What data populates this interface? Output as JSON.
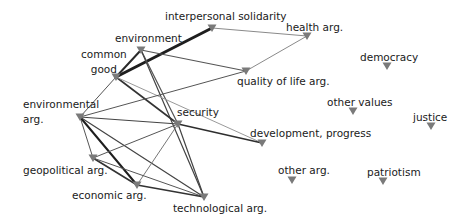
{
  "diagram": {
    "type": "network",
    "node_color": "#7a7a7a",
    "nodes": [
      {
        "id": "interpersonal_solidarity",
        "label": "interpersonal solidarity",
        "x": 212,
        "y": 28,
        "lx": 165,
        "ly": 10
      },
      {
        "id": "health",
        "label": "health arg.",
        "x": 307,
        "y": 36,
        "lx": 286,
        "ly": 21
      },
      {
        "id": "environment",
        "label": "environment",
        "x": 141,
        "y": 50,
        "lx": 115,
        "ly": 32
      },
      {
        "id": "common_good",
        "label": "common\ngood",
        "x": 116,
        "y": 77,
        "lx": 81,
        "ly": 47
      },
      {
        "id": "quality_of_life",
        "label": "quality of life arg.",
        "x": 246,
        "y": 71,
        "lx": 237,
        "ly": 75
      },
      {
        "id": "democracy",
        "label": "democracy",
        "x": 387,
        "y": 66,
        "lx": 360,
        "ly": 51
      },
      {
        "id": "environmental",
        "label": "environmental\narg.",
        "x": 80,
        "y": 117,
        "lx": 23,
        "ly": 97
      },
      {
        "id": "security",
        "label": "security",
        "x": 178,
        "y": 124,
        "lx": 177,
        "ly": 106
      },
      {
        "id": "other_values",
        "label": "other values",
        "x": 353,
        "y": 111,
        "lx": 327,
        "ly": 96
      },
      {
        "id": "justice",
        "label": "justice",
        "x": 431,
        "y": 126,
        "lx": 413,
        "ly": 111
      },
      {
        "id": "development",
        "label": "development, progress",
        "x": 262,
        "y": 143,
        "lx": 250,
        "ly": 127
      },
      {
        "id": "geopolitical",
        "label": "geopolitical arg.",
        "x": 93,
        "y": 158,
        "lx": 23,
        "ly": 164
      },
      {
        "id": "economic",
        "label": "economic arg.",
        "x": 137,
        "y": 185,
        "lx": 72,
        "ly": 189
      },
      {
        "id": "technological",
        "label": "technological arg.",
        "x": 204,
        "y": 197,
        "lx": 173,
        "ly": 202
      },
      {
        "id": "other_arg",
        "label": "other arg.",
        "x": 292,
        "y": 180,
        "lx": 278,
        "ly": 164
      },
      {
        "id": "patriotism",
        "label": "patriotism",
        "x": 383,
        "y": 181,
        "lx": 367,
        "ly": 166
      }
    ],
    "edges": [
      {
        "from": "common_good",
        "to": "interpersonal_solidarity",
        "weight": 3,
        "color": "#1e1e1e"
      },
      {
        "from": "interpersonal_solidarity",
        "to": "health",
        "weight": 1,
        "color": "#8a8a8a"
      },
      {
        "from": "health",
        "to": "quality_of_life",
        "weight": 1,
        "color": "#8a8a8a"
      },
      {
        "from": "environment",
        "to": "common_good",
        "weight": 2,
        "color": "#2a2a2a"
      },
      {
        "from": "environment",
        "to": "quality_of_life",
        "weight": 1.2,
        "color": "#555555"
      },
      {
        "from": "environment",
        "to": "security",
        "weight": 1.2,
        "color": "#555555"
      },
      {
        "from": "environment",
        "to": "technological",
        "weight": 1.2,
        "color": "#444444"
      },
      {
        "from": "common_good",
        "to": "environmental",
        "weight": 1,
        "color": "#555555"
      },
      {
        "from": "common_good",
        "to": "security",
        "weight": 1.6,
        "color": "#333333"
      },
      {
        "from": "common_good",
        "to": "development",
        "weight": 1,
        "color": "#9a9a9a"
      },
      {
        "from": "environmental",
        "to": "quality_of_life",
        "weight": 1,
        "color": "#555555"
      },
      {
        "from": "environmental",
        "to": "security",
        "weight": 1.2,
        "color": "#444444"
      },
      {
        "from": "environmental",
        "to": "geopolitical",
        "weight": 1,
        "color": "#555555"
      },
      {
        "from": "environmental",
        "to": "economic",
        "weight": 2,
        "color": "#1e1e1e"
      },
      {
        "from": "environmental",
        "to": "technological",
        "weight": 1.2,
        "color": "#444444"
      },
      {
        "from": "environmental",
        "to": "common_good_ext",
        "weight": 0,
        "color": "#ffffff"
      },
      {
        "from": "security",
        "to": "development",
        "weight": 1.6,
        "color": "#2e2e2e"
      },
      {
        "from": "security",
        "to": "geopolitical",
        "weight": 1,
        "color": "#555555"
      },
      {
        "from": "security",
        "to": "economic",
        "weight": 1,
        "color": "#777777"
      },
      {
        "from": "security",
        "to": "technological",
        "weight": 1.2,
        "color": "#444444"
      },
      {
        "from": "geopolitical",
        "to": "economic",
        "weight": 1.6,
        "color": "#333333"
      },
      {
        "from": "geopolitical",
        "to": "technological",
        "weight": 1,
        "color": "#555555"
      },
      {
        "from": "economic",
        "to": "technological",
        "weight": 1.6,
        "color": "#333333"
      },
      {
        "from": "environmental",
        "to": "economic_b",
        "weight": 0,
        "color": "#ffffff"
      }
    ]
  }
}
